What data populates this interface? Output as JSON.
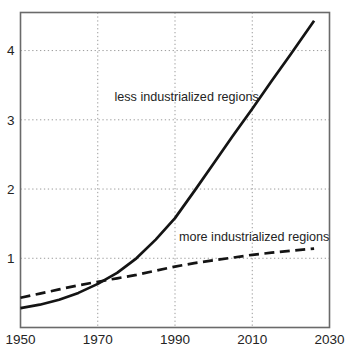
{
  "figure": {
    "background": "#ffffff",
    "frame_color": "#6a6a6a",
    "grid_color": "#9b9b9b",
    "line_color": "#141414",
    "text_color": "#242424"
  },
  "chart_data": {
    "type": "line",
    "xlim": [
      1950,
      2030
    ],
    "ylim": [
      0,
      4.55
    ],
    "x_ticks": [
      1950,
      1970,
      1990,
      2010,
      2030
    ],
    "y_ticks": [
      1,
      2,
      3,
      4
    ],
    "x_gridlines": [
      1970,
      1990,
      2010
    ],
    "y_gridlines": [
      1,
      2,
      3,
      4
    ],
    "grid_style": "dotted",
    "legend_position": "inline-labels",
    "series": [
      {
        "id": "less-industrialized",
        "name": "less industrialized regions",
        "style": "solid",
        "label_anchor": {
          "x": 1993,
          "y": 3.33
        },
        "points": [
          [
            1950,
            0.28
          ],
          [
            1955,
            0.33
          ],
          [
            1960,
            0.4
          ],
          [
            1965,
            0.5
          ],
          [
            1970,
            0.63
          ],
          [
            1975,
            0.79
          ],
          [
            1980,
            1.0
          ],
          [
            1985,
            1.27
          ],
          [
            1990,
            1.58
          ],
          [
            1995,
            1.97
          ],
          [
            2000,
            2.37
          ],
          [
            2005,
            2.77
          ],
          [
            2010,
            3.16
          ],
          [
            2015,
            3.56
          ],
          [
            2020,
            3.95
          ],
          [
            2026,
            4.43
          ]
        ]
      },
      {
        "id": "more-industrialized",
        "name": "more industrialized regions",
        "style": "dashed",
        "label_anchor": {
          "x": 2010.5,
          "y": 1.31
        },
        "points": [
          [
            1950,
            0.43
          ],
          [
            1955,
            0.49
          ],
          [
            1960,
            0.55
          ],
          [
            1965,
            0.61
          ],
          [
            1970,
            0.66
          ],
          [
            1975,
            0.71
          ],
          [
            1980,
            0.76
          ],
          [
            1985,
            0.82
          ],
          [
            1990,
            0.88
          ],
          [
            1995,
            0.93
          ],
          [
            2000,
            0.97
          ],
          [
            2005,
            1.01
          ],
          [
            2010,
            1.05
          ],
          [
            2015,
            1.08
          ],
          [
            2020,
            1.11
          ],
          [
            2026,
            1.14
          ]
        ]
      }
    ]
  }
}
